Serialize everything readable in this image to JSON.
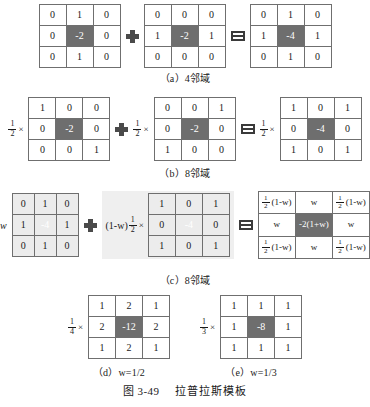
{
  "figure": {
    "number": "图 3-49",
    "title": "拉普拉斯模板"
  },
  "operators": {
    "plus": "plus-operator",
    "equals": "equals-operator",
    "times": "×"
  },
  "rows": [
    {
      "id": "a",
      "caption": "（a）4邻域",
      "terms": [
        {
          "coef": null,
          "matrix": [
            [
              "0",
              "1",
              "0"
            ],
            [
              "0",
              "-2",
              "0"
            ],
            [
              "0",
              "1",
              "0"
            ]
          ],
          "shaded": false
        },
        {
          "coef": null,
          "matrix": [
            [
              "0",
              "0",
              "0"
            ],
            [
              "1",
              "-2",
              "1"
            ],
            [
              "0",
              "0",
              "0"
            ]
          ],
          "shaded": false
        },
        {
          "coef": null,
          "matrix": [
            [
              "0",
              "1",
              "0"
            ],
            [
              "1",
              "-4",
              "1"
            ],
            [
              "0",
              "1",
              "0"
            ]
          ],
          "shaded": false
        }
      ]
    },
    {
      "id": "b",
      "caption": "（b）8邻域",
      "terms": [
        {
          "coef": {
            "num": "1",
            "den": "2",
            "times": "×"
          },
          "matrix": [
            [
              "1",
              "0",
              "0"
            ],
            [
              "0",
              "-2",
              "0"
            ],
            [
              "0",
              "0",
              "1"
            ]
          ],
          "shaded": false
        },
        {
          "coef": {
            "num": "1",
            "den": "2",
            "times": "×"
          },
          "matrix": [
            [
              "0",
              "0",
              "1"
            ],
            [
              "0",
              "-2",
              "0"
            ],
            [
              "1",
              "0",
              "0"
            ]
          ],
          "shaded": false
        },
        {
          "coef": {
            "num": "1",
            "den": "2",
            "times": "×"
          },
          "matrix": [
            [
              "1",
              "0",
              "1"
            ],
            [
              "0",
              "-4",
              "0"
            ],
            [
              "1",
              "0",
              "1"
            ]
          ],
          "shaded": false
        }
      ]
    },
    {
      "id": "c",
      "caption": "（c）8邻域",
      "terms": [
        {
          "coef": {
            "w": "w"
          },
          "matrix": [
            [
              "0",
              "1",
              "0"
            ],
            [
              "1",
              "-4",
              "1"
            ],
            [
              "0",
              "1",
              "0"
            ]
          ],
          "shaded": true
        },
        {
          "coef": {
            "paren": "(1-w)",
            "num": "1",
            "den": "2",
            "times": "×"
          },
          "matrix": [
            [
              "1",
              "0",
              "1"
            ],
            [
              "0",
              "-4",
              "0"
            ],
            [
              "1",
              "0",
              "1"
            ]
          ],
          "shaded": true
        },
        {
          "coef": null,
          "wide": true,
          "matrix": [
            [
              {
                "frac": {
                  "num": "1",
                  "den": "2"
                },
                "rest": "(1-w)"
              },
              "w",
              {
                "frac": {
                  "num": "1",
                  "den": "2"
                },
                "rest": "(1-w)"
              }
            ],
            [
              "w",
              "-2(1+w)",
              "w"
            ],
            [
              {
                "frac": {
                  "num": "1",
                  "den": "2"
                },
                "rest": "(1-w)"
              },
              "w",
              {
                "frac": {
                  "num": "1",
                  "den": "2"
                },
                "rest": "(1-w)"
              }
            ]
          ],
          "shaded": false
        }
      ]
    }
  ],
  "bottom": [
    {
      "id": "d",
      "caption": "（d）w=1/2",
      "coef": {
        "num": "1",
        "den": "4",
        "times": "×"
      },
      "matrix": [
        [
          "1",
          "2",
          "1"
        ],
        [
          "2",
          "-12",
          "2"
        ],
        [
          "1",
          "2",
          "1"
        ]
      ]
    },
    {
      "id": "e",
      "caption": "（e）w=1/3",
      "coef": {
        "num": "1",
        "den": "3",
        "times": "×"
      },
      "matrix": [
        [
          "1",
          "1",
          "1"
        ],
        [
          "1",
          "-8",
          "1"
        ],
        [
          "1",
          "1",
          "1"
        ]
      ]
    }
  ]
}
